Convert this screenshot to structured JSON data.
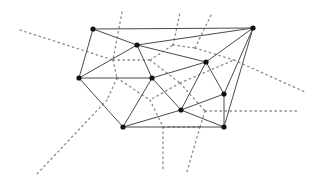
{
  "diagram": {
    "title": "",
    "type": "delaunay-triangulation-with-voronoi-overlay",
    "colors": {
      "edge": "#4a4a4a",
      "voronoi": "#8a8a8a",
      "node": "#111111",
      "background": "#ffffff"
    },
    "nodes": [
      {
        "id": "A",
        "x": 93,
        "y": 29
      },
      {
        "id": "B",
        "x": 137,
        "y": 45
      },
      {
        "id": "C",
        "x": 79,
        "y": 78
      },
      {
        "id": "D",
        "x": 152,
        "y": 78
      },
      {
        "id": "E",
        "x": 253,
        "y": 28
      },
      {
        "id": "F",
        "x": 206,
        "y": 62
      },
      {
        "id": "G",
        "x": 224,
        "y": 94
      },
      {
        "id": "H",
        "x": 123,
        "y": 127
      },
      {
        "id": "I",
        "x": 181,
        "y": 110
      },
      {
        "id": "J",
        "x": 224,
        "y": 127
      }
    ],
    "edges": [
      [
        "A",
        "E"
      ],
      [
        "A",
        "B"
      ],
      [
        "A",
        "C"
      ],
      [
        "B",
        "E"
      ],
      [
        "B",
        "C"
      ],
      [
        "B",
        "D"
      ],
      [
        "B",
        "F"
      ],
      [
        "C",
        "D"
      ],
      [
        "C",
        "H"
      ],
      [
        "D",
        "F"
      ],
      [
        "D",
        "H"
      ],
      [
        "D",
        "I"
      ],
      [
        "F",
        "E"
      ],
      [
        "F",
        "I"
      ],
      [
        "F",
        "G"
      ],
      [
        "E",
        "G"
      ],
      [
        "E",
        "J"
      ],
      [
        "G",
        "I"
      ],
      [
        "G",
        "J"
      ],
      [
        "I",
        "H"
      ],
      [
        "I",
        "J"
      ],
      [
        "H",
        "J"
      ]
    ],
    "voronoi_segments": [
      [
        20,
        30,
        113,
        60
      ],
      [
        122,
        12,
        113,
        60
      ],
      [
        113,
        60,
        117,
        78
      ],
      [
        113,
        60,
        150,
        60
      ],
      [
        117,
        78,
        107,
        100
      ],
      [
        107,
        100,
        36,
        175
      ],
      [
        117,
        78,
        150,
        100
      ],
      [
        150,
        60,
        173,
        45
      ],
      [
        173,
        45,
        180,
        13
      ],
      [
        173,
        45,
        195,
        48
      ],
      [
        195,
        48,
        212,
        13
      ],
      [
        195,
        48,
        234,
        60
      ],
      [
        150,
        60,
        180,
        83
      ],
      [
        180,
        83,
        234,
        60
      ],
      [
        234,
        60,
        305,
        92
      ],
      [
        180,
        83,
        150,
        100
      ],
      [
        150,
        100,
        163,
        127
      ],
      [
        180,
        83,
        205,
        111
      ],
      [
        205,
        111,
        298,
        111
      ],
      [
        205,
        111,
        200,
        127
      ],
      [
        163,
        127,
        200,
        127
      ],
      [
        163,
        127,
        163,
        170
      ],
      [
        200,
        127,
        186,
        175
      ]
    ]
  }
}
